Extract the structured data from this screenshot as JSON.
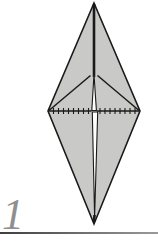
{
  "step": {
    "number": "1"
  },
  "diagram": {
    "paper_fill": "#c9c9c7",
    "line_color": "#1a1a1a",
    "gap_fill": "#ffffff",
    "outline_points": "94,3 140,111 94,224 48,111",
    "center_crease": {
      "x": 94,
      "y1": 4,
      "y2": 77
    },
    "upper_gap_points": "94,74 91.8,110.5 96.4,110.5",
    "left_flap_edge": {
      "x1": 90.5,
      "y1": 75.5,
      "x2": 49,
      "y2": 110.5
    },
    "right_flap_edge": {
      "x1": 97.5,
      "y1": 75.5,
      "x2": 139,
      "y2": 110.5
    },
    "fold_line_left": {
      "x1": 49,
      "y1": 111,
      "x2": 91.5,
      "y2": 111
    },
    "fold_line_right": {
      "x1": 96.8,
      "y1": 111,
      "x2": 139,
      "y2": 111
    },
    "fold_ticks": {
      "left_xs": [
        53.5,
        58.5,
        63.5,
        68.5,
        73.5,
        78.5,
        83.5,
        88.5
      ],
      "right_xs": [
        100,
        105,
        110,
        115,
        120,
        125,
        130,
        135
      ],
      "y": 111,
      "half_height": 3
    },
    "lower_gap_points": "92.3,112 97.7,112 94.6,217",
    "bottom_tip_crease": {
      "x1": 94.5,
      "y1": 215,
      "x2": 94,
      "y2": 222
    }
  },
  "footer": {
    "step_number_color": "#8f8f8f",
    "divider_color_left": "#3f3f3f",
    "divider_color_right": "#9a9a9a"
  }
}
